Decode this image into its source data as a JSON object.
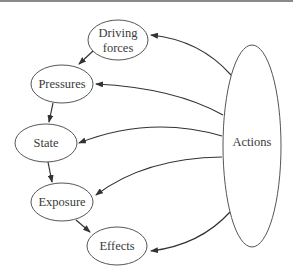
{
  "diagram": {
    "type": "DPSEEA framework flow diagram",
    "nodes": {
      "driving_forces": {
        "line1": "Driving",
        "line2": "forces"
      },
      "pressures": {
        "label": "Pressures"
      },
      "state": {
        "label": "State"
      },
      "exposure": {
        "label": "Exposure"
      },
      "effects": {
        "label": "Effects"
      },
      "actions": {
        "label": "Actions"
      }
    },
    "edges": [
      {
        "from": "Driving forces",
        "to": "Pressures"
      },
      {
        "from": "Pressures",
        "to": "State"
      },
      {
        "from": "State",
        "to": "Exposure"
      },
      {
        "from": "Exposure",
        "to": "Effects"
      },
      {
        "from": "Actions",
        "to": "Driving forces"
      },
      {
        "from": "Actions",
        "to": "Pressures"
      },
      {
        "from": "Actions",
        "to": "State"
      },
      {
        "from": "Actions",
        "to": "Exposure"
      },
      {
        "from": "Actions",
        "to": "Effects"
      }
    ],
    "colors": {
      "stroke": "#555555",
      "arrow": "#333333",
      "text": "#3a3a3a",
      "top_rule": "#8a8a8a",
      "background": "#ffffff"
    }
  }
}
